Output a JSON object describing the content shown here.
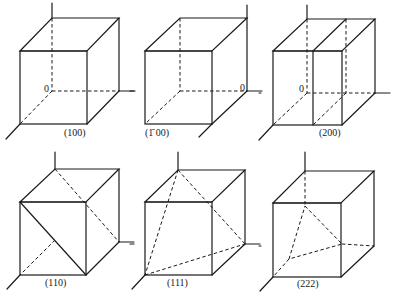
{
  "figure": {
    "panels": [
      {
        "id": "p100",
        "label": "(100)",
        "origin_label": "0",
        "plane": "(100)"
      },
      {
        "id": "pm100",
        "label": "(1̄ 00)",
        "origin_label": "0",
        "plane": "(-100)"
      },
      {
        "id": "p200",
        "label": "(200)",
        "origin_label": "0",
        "plane": "(200)"
      },
      {
        "id": "p110",
        "label": "(110)",
        "plane": "(110)"
      },
      {
        "id": "p111",
        "label": "(111)",
        "plane": "(111)"
      },
      {
        "id": "p222",
        "label": "(222)",
        "plane": "(222)"
      }
    ]
  },
  "colors": {
    "line": "#1a1a1a",
    "background": "#ffffff"
  }
}
